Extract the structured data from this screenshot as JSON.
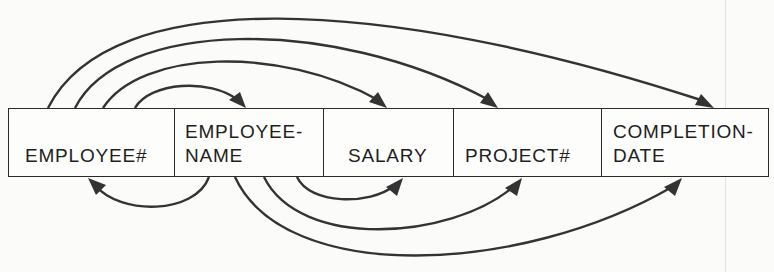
{
  "diagram": {
    "type": "functional-dependency-diagram",
    "fields": [
      {
        "id": "employee_no",
        "label": "EMPLOYEE#"
      },
      {
        "id": "employee_name",
        "label": "EMPLOYEE-\nNAME"
      },
      {
        "id": "salary",
        "label": "SALARY"
      },
      {
        "id": "project_no",
        "label": "PROJECT#"
      },
      {
        "id": "completion_date",
        "label": "COMPLETION-\nDATE"
      }
    ],
    "dependencies_above": [
      {
        "from": "EMPLOYEE#",
        "to": "EMPLOYEE-NAME"
      },
      {
        "from": "EMPLOYEE#",
        "to": "SALARY"
      },
      {
        "from": "EMPLOYEE#",
        "to": "PROJECT#"
      },
      {
        "from": "EMPLOYEE#",
        "to": "COMPLETION-DATE"
      }
    ],
    "dependencies_below": [
      {
        "from": "EMPLOYEE-NAME",
        "to": "EMPLOYEE#"
      },
      {
        "from": "EMPLOYEE-NAME",
        "to": "SALARY"
      },
      {
        "from": "EMPLOYEE-NAME",
        "to": "PROJECT#"
      },
      {
        "from": "EMPLOYEE-NAME",
        "to": "COMPLETION-DATE"
      }
    ],
    "colors": {
      "line": "#333333",
      "border": "#2a2a2a",
      "background": "#fbfbfa"
    }
  }
}
